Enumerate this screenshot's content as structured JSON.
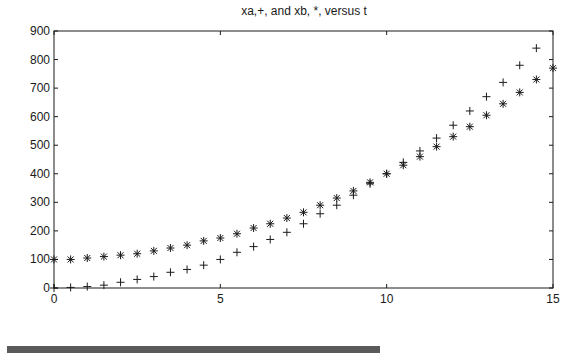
{
  "chart_data": {
    "type": "scatter",
    "title": "xa,+, and xb, *, versus t",
    "xlabel": "",
    "ylabel": "",
    "xlim": [
      0,
      15
    ],
    "ylim": [
      0,
      900
    ],
    "grid": false,
    "legend": null,
    "xticks": [
      0,
      5,
      10,
      15
    ],
    "yticks": [
      0,
      100,
      200,
      300,
      400,
      500,
      600,
      700,
      800,
      900
    ],
    "x": [
      0,
      0.5,
      1,
      1.5,
      2,
      2.5,
      3,
      3.5,
      4,
      4.5,
      5,
      5.5,
      6,
      6.5,
      7,
      7.5,
      8,
      8.5,
      9,
      9.5,
      10,
      10.5,
      11,
      11.5,
      12,
      12.5,
      13,
      13.5,
      14,
      14.5,
      15
    ],
    "series": [
      {
        "name": "xa",
        "marker": "+",
        "values": [
          0,
          2,
          5,
          10,
          20,
          30,
          40,
          55,
          65,
          80,
          100,
          125,
          145,
          170,
          195,
          225,
          260,
          290,
          325,
          365,
          400,
          440,
          480,
          525,
          570,
          620,
          670,
          720,
          780,
          840,
          null
        ]
      },
      {
        "name": "xb",
        "marker": "*",
        "values": [
          100,
          100,
          105,
          110,
          115,
          120,
          130,
          140,
          150,
          165,
          175,
          190,
          210,
          225,
          245,
          265,
          290,
          315,
          340,
          370,
          400,
          430,
          460,
          495,
          530,
          565,
          605,
          645,
          685,
          730,
          770
        ]
      }
    ]
  },
  "plot": {
    "left": 54,
    "right": 553,
    "top": 31,
    "bottom": 288,
    "axis_color": "#1a1a1a",
    "marker_color": "#1a1a1a"
  },
  "footer_bar": {
    "color": "#5a5a5a"
  }
}
